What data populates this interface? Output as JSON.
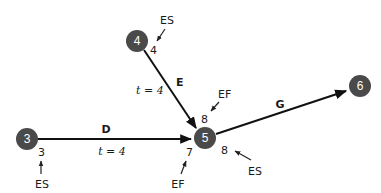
{
  "diagram": {
    "type": "activity-network (CPM) fragment",
    "nodes": [
      {
        "id": "3",
        "label": "3"
      },
      {
        "id": "4",
        "label": "4"
      },
      {
        "id": "5",
        "label": "5"
      },
      {
        "id": "6",
        "label": "6"
      }
    ],
    "edges": [
      {
        "id": "D",
        "label": "D",
        "from": "3",
        "to": "5",
        "duration": "t = 4"
      },
      {
        "id": "E",
        "label": "E",
        "from": "4",
        "to": "5",
        "duration": "t = 4"
      },
      {
        "id": "G",
        "label": "G",
        "from": "5",
        "to": "6"
      }
    ],
    "annotations": {
      "node4_es_label": "ES",
      "node4_es_value": "4",
      "node3_es_label": "ES",
      "node3_es_value": "3",
      "edgeE_ef_label": "EF",
      "edgeE_ef_value": "8",
      "edgeD_ef_label": "EF",
      "edgeD_ef_value": "7",
      "node5_es_label": "ES",
      "node5_es_value": "8"
    },
    "colors": {
      "node_fill": "#4a4a4a",
      "node_text": "#ffffff",
      "edge": "#111111"
    }
  }
}
